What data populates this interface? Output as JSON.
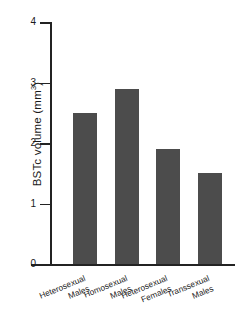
{
  "chart_data": {
    "type": "bar",
    "title": "",
    "xlabel": "",
    "ylabel": "BSTc volume (mm3)",
    "ylabel_base": "BSTc volume (mm",
    "ylabel_sup": "3",
    "ylabel_close": ")",
    "categories": [
      "Heterosexual Males",
      "Homosexual Males",
      "Heterosexual Females",
      "Transsexual Males"
    ],
    "category_lines": [
      [
        "Heterosexual",
        "Males"
      ],
      [
        "Homosexual",
        "Males"
      ],
      [
        "Heterosexual",
        "Females"
      ],
      [
        "Transsexual",
        "Males"
      ]
    ],
    "values": [
      2.5,
      2.9,
      1.9,
      1.5
    ],
    "ylim": [
      0,
      4
    ],
    "yticks": [
      0,
      1,
      2,
      3,
      4
    ],
    "ytick_labels": [
      "0",
      "1",
      "2",
      "3",
      "4"
    ],
    "grid": false,
    "legend": false,
    "bar_color": "#4c4c4c",
    "axis_color": "#232323",
    "background": "#ffffff"
  },
  "ticks": {
    "t0": "0",
    "t1": "1",
    "t2": "2",
    "t3": "3",
    "t4": "4"
  },
  "bars": {
    "b0_l1": "Heterosexual",
    "b0_l2": "Males",
    "b1_l1": "Homosexual",
    "b1_l2": "Males",
    "b2_l1": "Heterosexual",
    "b2_l2": "Females",
    "b3_l1": "Transsexual",
    "b3_l2": "Males"
  }
}
